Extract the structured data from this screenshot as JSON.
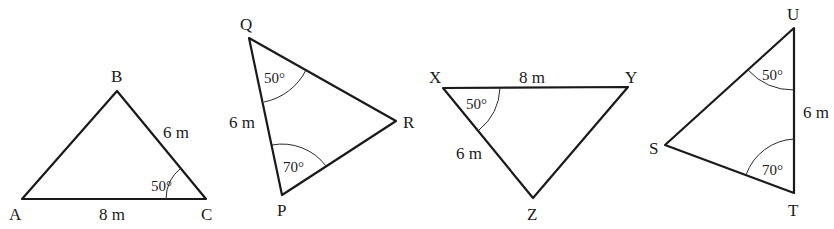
{
  "figure": {
    "triangles": [
      {
        "id": "ABC",
        "vertices": {
          "A": "A",
          "B": "B",
          "C": "C"
        },
        "sides": {
          "AC": "8 m",
          "BC": "6 m"
        },
        "angles": {
          "C": "50°"
        }
      },
      {
        "id": "PQR",
        "vertices": {
          "P": "P",
          "Q": "Q",
          "R": "R"
        },
        "sides": {
          "PQ": "6 m"
        },
        "angles": {
          "Q": "50°",
          "P": "70°"
        }
      },
      {
        "id": "XYZ",
        "vertices": {
          "X": "X",
          "Y": "Y",
          "Z": "Z"
        },
        "sides": {
          "XY": "8 m",
          "XZ": "6 m"
        },
        "angles": {
          "X": "50°"
        }
      },
      {
        "id": "STU",
        "vertices": {
          "S": "S",
          "T": "T",
          "U": "U"
        },
        "sides": {
          "TU": "6 m"
        },
        "angles": {
          "U": "50°",
          "T": "70°"
        }
      }
    ]
  }
}
